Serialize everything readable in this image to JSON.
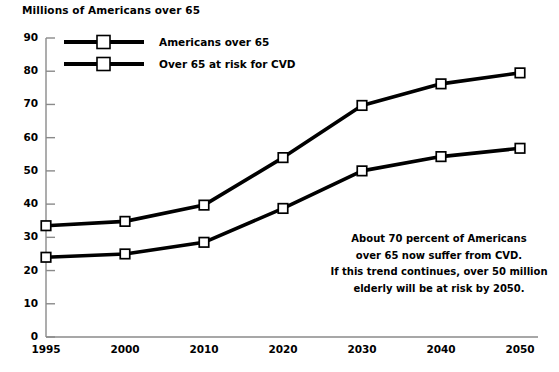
{
  "chart_data": {
    "type": "line",
    "title": "Millions of Americans over 65",
    "xlabel": "",
    "ylabel": "Millions of Americans over 65",
    "categories": [
      "1995",
      "2000",
      "2010",
      "2020",
      "2030",
      "2040",
      "2050"
    ],
    "x": [
      1995,
      2000,
      2010,
      2020,
      2030,
      2040,
      2050
    ],
    "series": [
      {
        "name": "Americans over 65",
        "values": [
          33.5,
          34.8,
          39.7,
          54.0,
          69.7,
          76.2,
          79.5
        ],
        "color": "#000000",
        "marker": "square"
      },
      {
        "name": "Over 65 at risk for CVD",
        "values": [
          24.0,
          25.0,
          28.5,
          38.7,
          50.0,
          54.3,
          56.8
        ],
        "color": "#000000",
        "marker": "square"
      }
    ],
    "ylim": [
      0,
      90
    ],
    "yticks": [
      0,
      10,
      20,
      30,
      40,
      50,
      60,
      70,
      80,
      90
    ],
    "ytick_labels": [
      "0",
      "10",
      "20",
      "30",
      "40",
      "50",
      "60",
      "70",
      "80",
      "90"
    ],
    "grid": false,
    "legend_position": "top-left-inside",
    "annotations": [
      "About 70 percent of Americans",
      "over 65 now suffer from CVD.",
      "If this trend continues, over 50 million",
      "elderly will be at risk by 2050."
    ],
    "axis_color": "#8a8a8a"
  },
  "legend": {
    "items": [
      {
        "label": "Americans over 65"
      },
      {
        "label": "Over 65 at risk for CVD"
      }
    ]
  }
}
